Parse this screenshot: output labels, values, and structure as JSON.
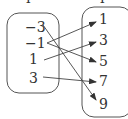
{
  "diagram": {
    "type": "mapping",
    "domain": [
      "−3",
      "−1",
      "1",
      "3"
    ],
    "range": [
      "1",
      "3",
      "5",
      "7",
      "9"
    ],
    "mappings": [
      {
        "from": "−3",
        "to": "9"
      },
      {
        "from": "−1",
        "to": "1"
      },
      {
        "from": "−1",
        "to": "5"
      },
      {
        "from": "1",
        "to": "3"
      },
      {
        "from": "3",
        "to": "7"
      }
    ],
    "colors": {
      "stroke": "#444444",
      "text": "#333333"
    }
  }
}
